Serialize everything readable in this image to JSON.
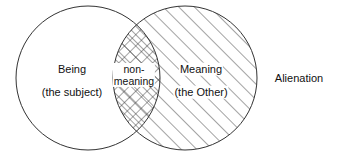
{
  "diagram": {
    "type": "venn-diagram",
    "background_color": "#ffffff",
    "stroke_color": "#333333",
    "text_color": "#111111",
    "left_circle": {
      "name": "being-circle",
      "fill": "none",
      "title": "Being",
      "subtitle": "(the subject)",
      "cx": 88,
      "cy": 78,
      "r": 72
    },
    "right_circle": {
      "name": "meaning-circle",
      "fill": "diagonal-hatch",
      "title": "Meaning",
      "subtitle": "(the Other)",
      "cx": 185,
      "cy": 78,
      "r": 72
    },
    "intersection": {
      "name": "non-meaning-lens",
      "fill": "cross-hatch",
      "line_1": "non-",
      "line_2": "meaning"
    },
    "outside_label": "Alienation"
  }
}
